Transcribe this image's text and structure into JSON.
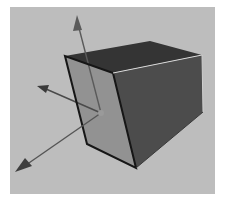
{
  "figure": {
    "colors": {
      "page_background": "#ffffff",
      "scene_background": "#bdbdbd",
      "top_face": "#343434",
      "right_face": "#4c4c4c",
      "front_face": "#8e8e8e",
      "edge": "#161616",
      "highlight_edge": "#d9d9d9",
      "axis": "#5a5a5a",
      "origin": "#9a9a9a"
    },
    "scene_box": {
      "x": 10,
      "y": 7,
      "width": 205,
      "height": 187
    },
    "cube": {
      "vertices": {
        "front_top_left": [
          65,
          56
        ],
        "front_top_right": [
          113,
          73
        ],
        "front_bottom_left": [
          87,
          144
        ],
        "front_bottom_right": [
          136,
          168
        ],
        "back_top": [
          150,
          41
        ],
        "right_top": [
          202,
          55
        ],
        "right_bottom": [
          203,
          112
        ]
      }
    },
    "axes": {
      "origin": [
        101,
        113
      ],
      "items": [
        {
          "name": "up",
          "tip": [
            77,
            15
          ]
        },
        {
          "name": "left",
          "tip": [
            37,
            86
          ]
        },
        {
          "name": "forward",
          "tip": [
            15,
            172
          ]
        }
      ]
    }
  }
}
